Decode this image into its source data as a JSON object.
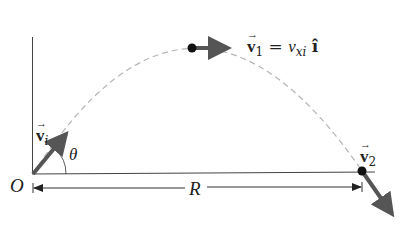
{
  "diagram": {
    "type": "projectile-motion",
    "labels": {
      "origin": "O",
      "angle": "θ",
      "range": "R",
      "initial_velocity": {
        "symbol": "v",
        "subscript": "i"
      },
      "peak_velocity": {
        "symbol": "v",
        "subscript": "1",
        "equals": "=",
        "rhs_symbol": "v",
        "rhs_subscript": "xi",
        "unit_vector": "î"
      },
      "final_velocity": {
        "symbol": "v",
        "subscript": "2"
      }
    },
    "colors": {
      "axes": "#444444",
      "trajectory": "#b0b0b0",
      "vector": "#555555",
      "point": "#111111",
      "text": "#222222"
    }
  }
}
